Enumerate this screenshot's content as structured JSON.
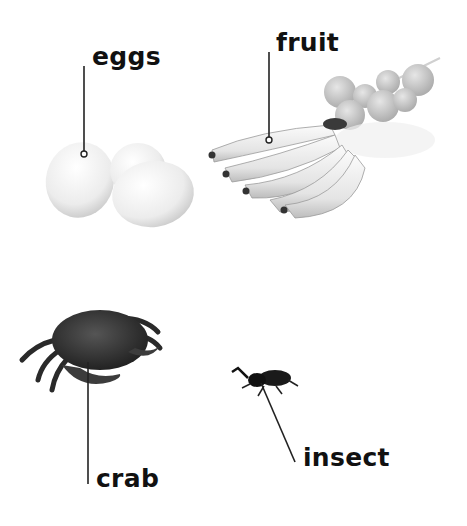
{
  "labels": {
    "eggs": "eggs",
    "fruit": "fruit",
    "crab": "crab",
    "insect": "insect"
  },
  "images": {
    "eggs": "eggs-image",
    "fruit": "bananas-and-oranges-image",
    "crab": "crab-image",
    "insect": "beetle-image"
  },
  "colors": {
    "text": "#111111",
    "line": "#222222",
    "background": "#ffffff"
  }
}
